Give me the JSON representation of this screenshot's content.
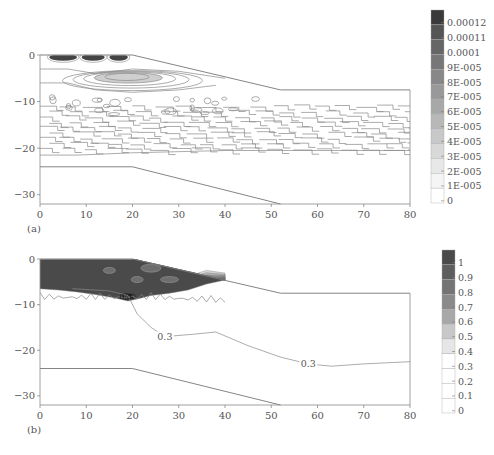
{
  "chart_data": [
    {
      "type": "heatmap",
      "panel_label": "(a)",
      "title": "",
      "xlabel": "",
      "ylabel": "",
      "xlim": [
        0,
        80
      ],
      "ylim": [
        -32,
        0
      ],
      "xticks": [
        0,
        10,
        20,
        30,
        40,
        50,
        60,
        70,
        80
      ],
      "xtick_labels": [
        "0",
        "10",
        "20",
        "30",
        "40",
        "50",
        "60",
        "70",
        "80"
      ],
      "yticks": [
        0,
        -10,
        -20,
        -30
      ],
      "ytick_labels": [
        "0",
        "−10",
        "−20",
        "−30"
      ],
      "colorbar": {
        "levels": [
          "0.00012",
          "0.00011",
          "0.0001",
          "9E-005",
          "8E-005",
          "7E-005",
          "6E-005",
          "5E-005",
          "4E-005",
          "3E-005",
          "2E-005",
          "1E-005",
          "0"
        ],
        "colors": [
          "#3a3a3a",
          "#555555",
          "#666666",
          "#777777",
          "#888888",
          "#999999",
          "#a8a8a8",
          "#b8b8b8",
          "#c8c8c8",
          "#d8d8d8",
          "#e8e8e8",
          "#f5f5f5",
          "#ffffff"
        ]
      },
      "geometry": {
        "surface": [
          [
            0,
            0
          ],
          [
            20,
            0
          ],
          [
            52,
            -7.5
          ],
          [
            80,
            -7.5
          ]
        ],
        "lower_boundary": [
          [
            0,
            -24
          ],
          [
            20,
            -24
          ],
          [
            52,
            -32
          ]
        ]
      },
      "contour_bands": [
        {
          "region": "near-surface",
          "x": [
            1,
            20
          ],
          "y": [
            0,
            -1
          ],
          "level": "0.00012"
        },
        {
          "region": "shallow lens",
          "x": [
            12,
            30
          ],
          "y": [
            -4,
            -7
          ],
          "level": "6E-005"
        },
        {
          "region": "stepped layer",
          "x": [
            0,
            80
          ],
          "y": [
            -10,
            -21
          ],
          "level": "1E-005"
        }
      ],
      "grid": false
    },
    {
      "type": "heatmap",
      "panel_label": "(b)",
      "title": "",
      "xlabel": "",
      "ylabel": "",
      "xlim": [
        0,
        80
      ],
      "ylim": [
        -32,
        0
      ],
      "xticks": [
        0,
        10,
        20,
        30,
        40,
        50,
        60,
        70,
        80
      ],
      "xtick_labels": [
        "0",
        "10",
        "20",
        "30",
        "40",
        "50",
        "60",
        "70",
        "80"
      ],
      "yticks": [
        0,
        -10,
        -20,
        -30
      ],
      "ytick_labels": [
        "0",
        "−10",
        "−20",
        "−30"
      ],
      "colorbar": {
        "levels": [
          "1",
          "0.9",
          "0.8",
          "0.7",
          "0.6",
          "0.5",
          "0.4",
          "0.3",
          "0.2",
          "0.1",
          "0"
        ],
        "colors": [
          "#4a4a4a",
          "#5e5e5e",
          "#747474",
          "#8a8a8a",
          "#a8a8a8",
          "#c8c8c8",
          "#e6e6e6",
          "#ffffff",
          "#ffffff",
          "#ffffff",
          "#ffffff"
        ]
      },
      "geometry": {
        "surface": [
          [
            0,
            0
          ],
          [
            20,
            0
          ],
          [
            52,
            -7.5
          ],
          [
            80,
            -7.5
          ]
        ],
        "lower_boundary": [
          [
            0,
            -24
          ],
          [
            20,
            -24
          ],
          [
            52,
            -32
          ]
        ]
      },
      "contour_labels": [
        {
          "text": "0.3",
          "x": 27,
          "y": -17
        },
        {
          "text": "0.3",
          "x": 58,
          "y": -23
        },
        {
          "text": "0.3",
          "x": 18.5,
          "y": -8
        }
      ],
      "contour_line_0.3": [
        [
          7,
          -6.5
        ],
        [
          15,
          -7
        ],
        [
          19,
          -8
        ],
        [
          21,
          -12
        ],
        [
          24,
          -15
        ],
        [
          27,
          -17
        ],
        [
          33,
          -16.5
        ],
        [
          38,
          -16
        ],
        [
          45,
          -19
        ],
        [
          52,
          -21.5
        ],
        [
          58,
          -23
        ],
        [
          63,
          -23.5
        ],
        [
          70,
          -23
        ],
        [
          80,
          -22.5
        ]
      ],
      "saturated_region": {
        "x": [
          0,
          40
        ],
        "y_top": 0,
        "y_bottom": -8,
        "level": ">0.9"
      },
      "grid": false
    }
  ]
}
